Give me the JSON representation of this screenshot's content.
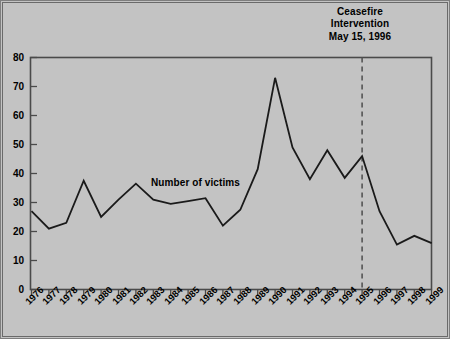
{
  "annotation": {
    "line1": "Ceasefire",
    "line2": "Intervention",
    "line3": "May 15, 1996"
  },
  "series_label": "Number of victims",
  "colors": {
    "background": "#c3c3c3",
    "line": "#1a1a1a",
    "axis": "#4a4a4a",
    "text": "#000000",
    "marker_line": "#555555"
  },
  "chart_data": {
    "type": "line",
    "title": "",
    "subtitle": "",
    "xlabel": "",
    "ylabel": "",
    "categories": [
      "1976",
      "1977",
      "1978",
      "1979",
      "1980",
      "1981",
      "1982",
      "1983",
      "1984",
      "1985",
      "1986",
      "1987",
      "1988",
      "1989",
      "1990",
      "1991",
      "1992",
      "1993",
      "1994",
      "1995",
      "1996",
      "1997",
      "1998",
      "1999"
    ],
    "series": [
      {
        "name": "Number of victims",
        "values": [
          27,
          21,
          23,
          37.5,
          25,
          31,
          36.5,
          31,
          29.5,
          30.5,
          31.5,
          22,
          27.5,
          41.5,
          73,
          49,
          38,
          48,
          38.5,
          46,
          27,
          15.5,
          18.5,
          16
        ]
      }
    ],
    "ylim": [
      0,
      80
    ],
    "yticks": [
      0,
      10,
      20,
      30,
      40,
      50,
      60,
      70,
      80
    ],
    "ytick_labels": [
      "0",
      "10",
      "20",
      "30",
      "40",
      "50",
      "60",
      "70",
      "80"
    ],
    "grid": false,
    "legend": "none",
    "annotations": [
      {
        "name": "ceasefire-marker",
        "text": "Ceasefire Intervention May 15, 1996",
        "at_category": "1995",
        "style": "dashed-vertical-line"
      },
      {
        "name": "series-inline-label",
        "text": "Number of victims",
        "at_category": "1984"
      }
    ]
  }
}
